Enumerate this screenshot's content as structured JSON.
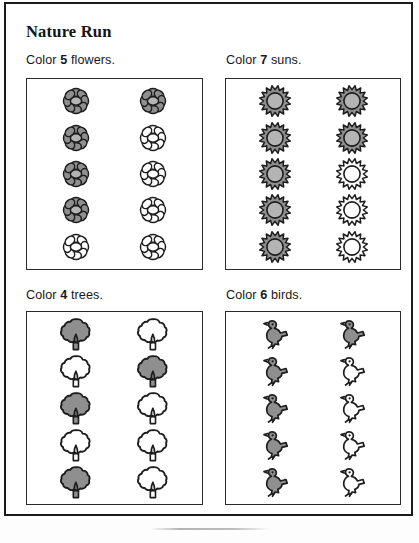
{
  "worksheet": {
    "title": "Nature Run",
    "artifact_label": "scan-artifact"
  },
  "exercises": [
    {
      "id": "flowers",
      "instruction_prefix": "Color ",
      "count": "5",
      "instruction_suffix": " flowers.",
      "icon": "flower-icon",
      "total_items": 10,
      "columns": 2,
      "rows": 5,
      "colored_count": 5,
      "colored_cells": [
        true,
        true,
        true,
        true,
        false,
        true,
        false,
        false,
        false,
        false
      ]
    },
    {
      "id": "suns",
      "instruction_prefix": "Color ",
      "count": "7",
      "instruction_suffix": " suns.",
      "icon": "sun-icon",
      "total_items": 10,
      "columns": 2,
      "rows": 5,
      "colored_count": 7,
      "colored_cells": [
        true,
        true,
        true,
        true,
        true,
        true,
        true,
        false,
        false,
        false
      ]
    },
    {
      "id": "trees",
      "instruction_prefix": "Color ",
      "count": "4",
      "instruction_suffix": " trees.",
      "icon": "tree-icon",
      "total_items": 10,
      "columns": 2,
      "rows": 5,
      "colored_count": 4,
      "colored_cells": [
        true,
        false,
        true,
        false,
        true,
        false,
        true,
        false,
        false,
        false
      ]
    },
    {
      "id": "birds",
      "instruction_prefix": "Color ",
      "count": "6",
      "instruction_suffix": " birds.",
      "icon": "bird-icon",
      "total_items": 10,
      "columns": 2,
      "rows": 5,
      "colored_count": 6,
      "colored_cells": [
        true,
        true,
        true,
        true,
        true,
        true,
        false,
        false,
        false,
        false
      ]
    }
  ],
  "colors": {
    "ink": "#1d1d1d",
    "page": "#ffffff",
    "colored_fill": "#8f8f8f",
    "uncolored_fill": "#ffffff",
    "frame": "#1b1b1b"
  }
}
